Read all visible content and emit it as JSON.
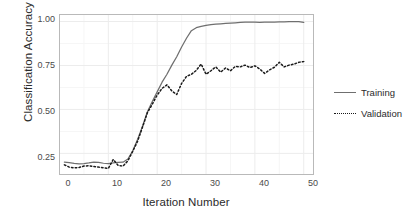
{
  "chart_data": {
    "type": "line",
    "title": "",
    "xlabel": "Iteration Number",
    "ylabel": "Classification Accuracy",
    "xlim": [
      0,
      52
    ],
    "ylim": [
      0.13,
      1.04
    ],
    "xticks": [
      0,
      10,
      20,
      30,
      40,
      50
    ],
    "xticklabels": [
      "0",
      "10",
      "20",
      "30",
      "40",
      "50"
    ],
    "yticks": [
      0.25,
      0.5,
      0.75,
      1.0
    ],
    "yticklabels": [
      "0.25",
      "0.50",
      "0.75",
      "1.00"
    ],
    "grid": true,
    "legend_position": "right",
    "x": [
      1,
      2,
      3,
      4,
      5,
      6,
      7,
      8,
      9,
      10,
      11,
      12,
      13,
      14,
      15,
      16,
      17,
      18,
      19,
      20,
      21,
      22,
      23,
      24,
      25,
      26,
      27,
      28,
      29,
      30,
      31,
      32,
      33,
      34,
      35,
      36,
      37,
      38,
      39,
      40,
      41,
      42,
      43,
      44,
      45,
      46,
      47,
      48,
      49,
      50
    ],
    "series": [
      {
        "name": "Training",
        "style": "solid",
        "color": "#6f6f6f",
        "values": [
          0.2,
          0.197,
          0.193,
          0.191,
          0.192,
          0.196,
          0.201,
          0.199,
          0.194,
          0.192,
          0.196,
          0.199,
          0.2,
          0.218,
          0.265,
          0.33,
          0.405,
          0.487,
          0.545,
          0.6,
          0.655,
          0.7,
          0.752,
          0.8,
          0.855,
          0.905,
          0.948,
          0.965,
          0.972,
          0.978,
          0.982,
          0.985,
          0.987,
          0.989,
          0.991,
          0.993,
          0.995,
          0.996,
          0.997,
          0.996,
          0.995,
          0.996,
          0.996,
          0.997,
          0.998,
          0.998,
          0.999,
          0.999,
          1.0,
          0.995
        ]
      },
      {
        "name": "Validation",
        "style": "dotted",
        "color": "#1a1a1a",
        "values": [
          0.185,
          0.172,
          0.168,
          0.17,
          0.178,
          0.18,
          0.175,
          0.172,
          0.168,
          0.165,
          0.215,
          0.182,
          0.178,
          0.208,
          0.262,
          0.32,
          0.4,
          0.482,
          0.53,
          0.582,
          0.62,
          0.64,
          0.605,
          0.585,
          0.648,
          0.688,
          0.7,
          0.722,
          0.758,
          0.7,
          0.72,
          0.742,
          0.712,
          0.736,
          0.72,
          0.745,
          0.742,
          0.752,
          0.738,
          0.748,
          0.73,
          0.705,
          0.725,
          0.74,
          0.768,
          0.742,
          0.752,
          0.758,
          0.768,
          0.772
        ]
      }
    ],
    "legend_entries": [
      {
        "label": "Training",
        "style": "solid"
      },
      {
        "label": "Validation",
        "style": "dotted"
      }
    ]
  },
  "theme": {
    "panel_background": "#ffffff",
    "panel_border": "#b9b9b9",
    "grid_major": "#ececec",
    "grid_minor": "#f6f6f6",
    "text_color": "#2b2b2b",
    "tick_color": "#4a4a4a"
  }
}
